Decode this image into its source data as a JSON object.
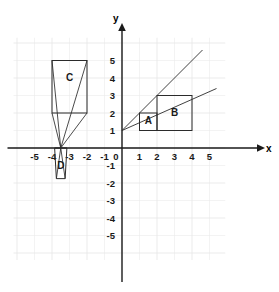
{
  "figure": {
    "kind": "coordinate-plane-diagram",
    "axis_labels": {
      "x": "x",
      "y": "y"
    },
    "x_ticks": [
      "-5",
      "-4",
      "-3",
      "-2",
      "-1",
      "0",
      "1",
      "2",
      "3",
      "4",
      "5"
    ],
    "y_ticks": [
      "5",
      "4",
      "3",
      "2",
      "1",
      "-1",
      "-2",
      "-3",
      "-4",
      "-5"
    ],
    "shape_labels": {
      "a": "A",
      "b": "B",
      "c": "C",
      "d": "D"
    },
    "colors": {
      "grid": "#e9e9e9",
      "axis": "#1a1a1a",
      "shape_stroke": "#2b2b2b",
      "background": "#ffffff"
    }
  },
  "chart_data": {
    "type": "scatter",
    "title": "",
    "xlabel": "x",
    "ylabel": "y",
    "xlim": [
      -6.2,
      5.9
    ],
    "ylim": [
      -6.4,
      6.3
    ],
    "xticks": [
      -5,
      -4,
      -3,
      -2,
      -1,
      0,
      1,
      2,
      3,
      4,
      5
    ],
    "yticks": [
      -5,
      -4,
      -3,
      -2,
      -1,
      1,
      2,
      3,
      4,
      5
    ],
    "grid": true,
    "legend": "none",
    "shapes": [
      {
        "name": "A",
        "label": "A",
        "type": "rectangle",
        "x_range": [
          1,
          2
        ],
        "y_range": [
          1,
          2
        ],
        "label_point": [
          1.5,
          1.4
        ]
      },
      {
        "name": "B",
        "label": "B",
        "type": "rectangle",
        "x_range": [
          2,
          4
        ],
        "y_range": [
          1,
          3
        ],
        "label_point": [
          3,
          1.85
        ]
      },
      {
        "name": "C",
        "label": "C",
        "type": "rectangle",
        "x_range": [
          -4,
          -2
        ],
        "y_range": [
          2,
          5
        ],
        "label_point": [
          -3,
          3.85
        ]
      },
      {
        "name": "D",
        "label": "D",
        "type": "quadrilateral",
        "vertices": [
          [
            -3.85,
            0
          ],
          [
            -3.15,
            0
          ],
          [
            -3.25,
            -1.75
          ],
          [
            -3.75,
            -1.75
          ]
        ],
        "label_point": [
          -3.5,
          -1.2
        ]
      }
    ],
    "rays": [
      {
        "name": "ray-upper",
        "from": [
          0,
          1
        ],
        "to": [
          4.6,
          5.6
        ]
      },
      {
        "name": "ray-lower",
        "from": [
          0,
          1
        ],
        "to": [
          5.4,
          3.4
        ]
      }
    ],
    "projection_center": [
      -3.5,
      0
    ],
    "projection_lines": [
      {
        "from": [
          -4,
          5
        ],
        "to": [
          -3.5,
          0
        ]
      },
      {
        "from": [
          -2,
          5
        ],
        "to": [
          -3.5,
          0
        ]
      },
      {
        "from": [
          -4,
          2
        ],
        "to": [
          -3.5,
          0
        ]
      },
      {
        "from": [
          -2,
          2
        ],
        "to": [
          -3.5,
          0
        ]
      },
      {
        "from": [
          -3.5,
          0
        ],
        "to": [
          -3.75,
          -1.75
        ]
      },
      {
        "from": [
          -3.5,
          0
        ],
        "to": [
          -3.25,
          -1.75
        ]
      },
      {
        "from": [
          -3.5,
          0
        ],
        "to": [
          -3.85,
          0
        ]
      },
      {
        "from": [
          -3.5,
          0
        ],
        "to": [
          -3.15,
          0
        ]
      }
    ]
  }
}
